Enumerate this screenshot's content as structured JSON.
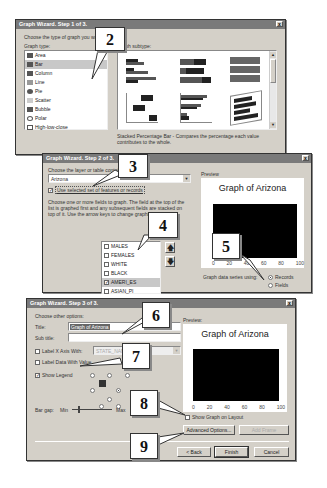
{
  "step1": {
    "title": "Graph Wizard. Step 1 of 3.",
    "prompt": "Choose the type of graph you want:",
    "graph_type_label": "Graph type:",
    "graph_subtype_label": "Graph subtype:",
    "graph_types": [
      "Area",
      "Bar",
      "Column",
      "Line",
      "Pie",
      "Scatter",
      "Bubble",
      "Polar",
      "High-low-close"
    ],
    "selected_type": "Bar",
    "description": "Stacked Percentage Bar - Compares the percentage each value contributes to the whole.",
    "close": "x"
  },
  "step2": {
    "title": "Graph Wizard. Step 2 of 3.",
    "layer_label": "Choose the layer or table containing the data:",
    "layer_value": "Arizona",
    "use_selected_label": "Use selected set of features or records",
    "use_selected_checked": true,
    "fields_instructions": "Choose one or more fields to graph. The field at the top of the list is graphed first and any subsequent fields are stacked on top of it. Use the arrow keys to change graphing order.",
    "fields": [
      {
        "name": "MALES",
        "checked": false
      },
      {
        "name": "FEMALES",
        "checked": false
      },
      {
        "name": "WHITE",
        "checked": false
      },
      {
        "name": "BLACK",
        "checked": false
      },
      {
        "name": "AMERI_ES",
        "checked": true
      },
      {
        "name": "ASIAN_PI",
        "checked": false
      }
    ],
    "preview_label": "Preview",
    "preview_title": "Graph of Arizona",
    "axis_ticks": [
      "0",
      "20",
      "40",
      "60",
      "80",
      "100"
    ],
    "series_label": "Graph data series using:",
    "series_options": [
      "Records",
      "Fields"
    ],
    "series_selected": "Records",
    "close": "x"
  },
  "step3": {
    "title": "Graph Wizard. Step 3 of 3.",
    "prompt": "Choose other options:",
    "title_label": "Title:",
    "title_value": "Graph of Arizona",
    "subtitle_label": "Sub title:",
    "subtitle_value": "",
    "label_xaxis_label": "Label X Axis With:",
    "label_xaxis_value": "STATE_NAME",
    "label_data_label": "Label Data With Value",
    "show_legend_label": "Show Legend",
    "show_legend_checked": true,
    "bar_gap_label": "Bar gap:",
    "bar_gap_min": "Min",
    "bar_gap_max": "Max",
    "preview_label": "Preview:",
    "preview_title": "Graph of Arizona",
    "axis_ticks": [
      "0",
      "20",
      "40",
      "60",
      "80",
      "100"
    ],
    "show_on_layout_label": "Show Graph on Layout",
    "advanced_button": "Advanced Options...",
    "add_frame_button": "Add Frame",
    "back_button": "< Back",
    "finish_button": "Finish",
    "cancel_button": "Cancel",
    "close": "x"
  },
  "callouts": [
    "2",
    "3",
    "4",
    "5",
    "6",
    "7",
    "8",
    "9"
  ]
}
